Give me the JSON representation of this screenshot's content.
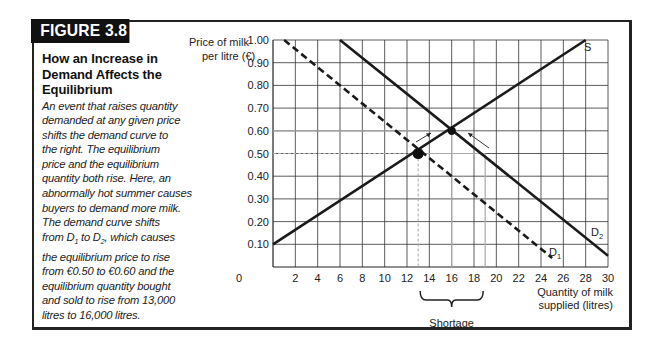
{
  "figure": {
    "label": "FIGURE 3.8",
    "title": "How an Increase in Demand Affects the Equilibrium",
    "caption_lines": [
      "An event that raises quantity",
      "demanded at any given price",
      "shifts the demand curve to",
      "the right. The equilibrium",
      "price and the equilibrium",
      "quantity both rise. Here, an",
      "abnormally hot summer causes",
      "buyers to demand more milk.",
      "The demand curve shifts",
      "from D1 to D2, which causes",
      "the equilibrium price to rise",
      "from €0.50 to €0.60 and the",
      "equilibrium quantity bought",
      "and sold to rise from 13,000",
      "litres to 16,000 litres."
    ]
  },
  "colors": {
    "frame": "#222222",
    "label_bg": "#111111",
    "grid": "#333333",
    "curve": "#1a1a1a",
    "guide": "#aaaaaa"
  },
  "chart_data": {
    "type": "line",
    "title": "How an Increase in Demand Affects the Equilibrium",
    "xlabel": "Quantity of milk supplied (litres)",
    "xlabel_lines": [
      "Quantity of milk",
      "supplied (litres)"
    ],
    "ylabel": "Price of milk per litre (€)",
    "ylabel_lines": [
      "Price of milk",
      "per litre (€)"
    ],
    "xlim": [
      0,
      30
    ],
    "ylim": [
      0,
      1.0
    ],
    "x_ticks": [
      0,
      2,
      4,
      6,
      8,
      10,
      12,
      14,
      16,
      18,
      20,
      22,
      24,
      26,
      28,
      30
    ],
    "y_ticks": [
      "0.10",
      "0.20",
      "0.30",
      "0.40",
      "0.50",
      "0.60",
      "0.70",
      "0.80",
      "0.90",
      "1.00"
    ],
    "grid": true,
    "series": [
      {
        "name": "S",
        "style": "solid",
        "points": [
          [
            0,
            0.1
          ],
          [
            28,
            1.0
          ]
        ]
      },
      {
        "name": "D1",
        "style": "dashed",
        "points": [
          [
            1,
            1.0
          ],
          [
            25,
            0.04
          ]
        ]
      },
      {
        "name": "D2",
        "style": "solid",
        "points": [
          [
            6,
            1.0
          ],
          [
            30,
            0.05
          ]
        ]
      }
    ],
    "equilibria": [
      {
        "label": "initial",
        "x": 13,
        "y": 0.5
      },
      {
        "label": "new",
        "x": 16,
        "y": 0.6
      }
    ],
    "annotations": [
      {
        "text": "S",
        "x": 28.3,
        "y": 0.97
      },
      {
        "text": "D1",
        "x": 24.3,
        "y": 0.12
      },
      {
        "text": "D2",
        "x": 28.6,
        "y": 0.15
      },
      {
        "text": "Shortage",
        "range_x": [
          13,
          19
        ],
        "at_price": 0.5
      }
    ],
    "legend": "none"
  }
}
